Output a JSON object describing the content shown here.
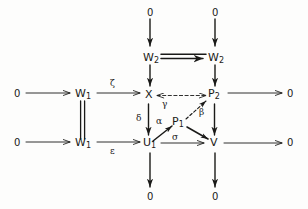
{
  "diagram": {
    "kind": "commutative-diagram",
    "title": "",
    "ink_color": "#1a1a18",
    "background_color": "#fdfdfc",
    "nodes": [
      {
        "id": "zero-top-left",
        "text": "0",
        "sub": "",
        "x": 150,
        "y": 12
      },
      {
        "id": "zero-top-right",
        "text": "0",
        "sub": "",
        "x": 215,
        "y": 12
      },
      {
        "id": "w2-left",
        "text": "W",
        "sub": "2",
        "x": 150,
        "y": 58
      },
      {
        "id": "w2-right",
        "text": "W",
        "sub": "2",
        "x": 215,
        "y": 58
      },
      {
        "id": "zero-mid-left",
        "text": "0",
        "sub": "",
        "x": 17,
        "y": 96
      },
      {
        "id": "w1-upper",
        "text": "W",
        "sub": "1",
        "x": 82,
        "y": 96
      },
      {
        "id": "x-node",
        "text": "X",
        "sub": "",
        "x": 148,
        "y": 96
      },
      {
        "id": "p2-node",
        "text": "P",
        "sub": "2",
        "x": 213,
        "y": 96
      },
      {
        "id": "zero-mid-right",
        "text": "0",
        "sub": "",
        "x": 290,
        "y": 96
      },
      {
        "id": "p1-node",
        "text": "P",
        "sub": "1",
        "x": 178,
        "y": 124
      },
      {
        "id": "zero-low-left",
        "text": "0",
        "sub": "",
        "x": 17,
        "y": 145
      },
      {
        "id": "w1-lower",
        "text": "W",
        "sub": "1",
        "x": 82,
        "y": 145
      },
      {
        "id": "u1-node",
        "text": "U",
        "sub": "1",
        "x": 148,
        "y": 145
      },
      {
        "id": "v-node",
        "text": "V",
        "sub": "",
        "x": 213,
        "y": 145
      },
      {
        "id": "zero-bot-right",
        "text": "0",
        "sub": "",
        "x": 290,
        "y": 145
      },
      {
        "id": "zero-bottom-u1",
        "text": "0",
        "sub": "",
        "x": 150,
        "y": 196
      },
      {
        "id": "zero-bottom-v",
        "text": "0",
        "sub": "",
        "x": 215,
        "y": 196
      }
    ],
    "edge_labels": [
      {
        "id": "zeta",
        "text": "ζ",
        "x": 112,
        "y": 84
      },
      {
        "id": "gamma",
        "text": "γ",
        "x": 165,
        "y": 105
      },
      {
        "id": "beta",
        "text": "β",
        "x": 201,
        "y": 112
      },
      {
        "id": "delta",
        "text": "δ",
        "x": 139,
        "y": 119
      },
      {
        "id": "alpha",
        "text": "α",
        "x": 159,
        "y": 121
      },
      {
        "id": "epsilon",
        "text": "ε",
        "x": 112,
        "y": 151
      },
      {
        "id": "sigma",
        "text": "σ",
        "x": 174,
        "y": 138
      }
    ],
    "edges": [
      {
        "id": "edge-zero-to-w2-left",
        "from": "zero-top-left",
        "to": "w2-left",
        "style": "solid-arrow",
        "label": ""
      },
      {
        "id": "edge-zero-to-w2-right",
        "from": "zero-top-right",
        "to": "w2-right",
        "style": "solid-arrow",
        "label": ""
      },
      {
        "id": "edge-w2-to-w2",
        "from": "w2-left",
        "to": "w2-right",
        "style": "double-arrow",
        "label": ""
      },
      {
        "id": "edge-w2-to-x",
        "from": "w2-left",
        "to": "x-node",
        "style": "solid-arrow",
        "label": ""
      },
      {
        "id": "edge-w2-to-p2",
        "from": "w2-right",
        "to": "p2-node",
        "style": "solid-arrow",
        "label": ""
      },
      {
        "id": "edge-zero-to-w1-upper",
        "from": "zero-mid-left",
        "to": "w1-upper",
        "style": "solid-arrow",
        "label": ""
      },
      {
        "id": "edge-w1-to-x",
        "from": "w1-upper",
        "to": "x-node",
        "style": "solid-arrow",
        "label": "ζ"
      },
      {
        "id": "edge-w1-to-w1",
        "from": "w1-upper",
        "to": "w1-lower",
        "style": "double-line",
        "label": ""
      },
      {
        "id": "edge-x-to-p2",
        "from": "x-node",
        "to": "p2-node",
        "style": "dashed-bidirectional",
        "label": "γ"
      },
      {
        "id": "edge-p2-to-zero",
        "from": "p2-node",
        "to": "zero-mid-right",
        "style": "solid-arrow",
        "label": ""
      },
      {
        "id": "edge-x-to-u1",
        "from": "x-node",
        "to": "u1-node",
        "style": "solid-arrow",
        "label": "δ"
      },
      {
        "id": "edge-p2-to-v",
        "from": "p2-node",
        "to": "v-node",
        "style": "solid-arrow",
        "label": ""
      },
      {
        "id": "edge-u1-to-p1",
        "from": "u1-node",
        "to": "p1-node",
        "style": "solid-arrow",
        "label": "α"
      },
      {
        "id": "edge-p1-to-p2",
        "from": "p1-node",
        "to": "p2-node",
        "style": "dashed-arrow",
        "label": "β"
      },
      {
        "id": "edge-p1-to-v",
        "from": "p1-node",
        "to": "v-node",
        "style": "solid-arrow",
        "label": ""
      },
      {
        "id": "edge-zero-to-w1-lower",
        "from": "zero-low-left",
        "to": "w1-lower",
        "style": "solid-arrow",
        "label": ""
      },
      {
        "id": "edge-w1-to-u1",
        "from": "w1-lower",
        "to": "u1-node",
        "style": "solid-arrow",
        "label": "ε"
      },
      {
        "id": "edge-u1-to-v",
        "from": "u1-node",
        "to": "v-node",
        "style": "solid-arrow",
        "label": "σ"
      },
      {
        "id": "edge-v-to-zero",
        "from": "v-node",
        "to": "zero-bot-right",
        "style": "solid-arrow",
        "label": ""
      },
      {
        "id": "edge-u1-to-zero",
        "from": "u1-node",
        "to": "zero-bottom-u1",
        "style": "solid-arrow",
        "label": ""
      },
      {
        "id": "edge-v-to-zero-bottom",
        "from": "v-node",
        "to": "zero-bottom-v",
        "style": "solid-arrow",
        "label": ""
      }
    ]
  }
}
